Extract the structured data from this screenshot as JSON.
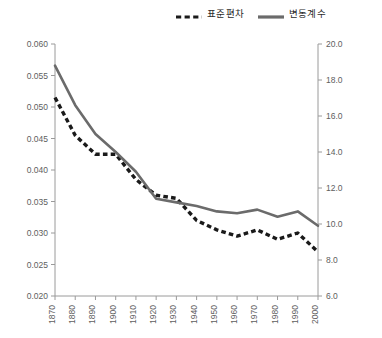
{
  "chart_data": {
    "type": "line",
    "title": "",
    "xlabel": "",
    "ylabel": "",
    "grid": false,
    "legend_position": "top-right",
    "x": [
      1870,
      1880,
      1890,
      1900,
      1910,
      1920,
      1930,
      1940,
      1950,
      1960,
      1970,
      1980,
      1990,
      2000
    ],
    "categories": [
      "1870",
      "1880",
      "1890",
      "1900",
      "1910",
      "1920",
      "1930",
      "1940",
      "1950",
      "1960",
      "1970",
      "1980",
      "1990",
      "2000"
    ],
    "axes": {
      "left": {
        "label": "",
        "ylim": [
          0.02,
          0.06
        ],
        "ticks": [
          "0.020",
          "0.025",
          "0.030",
          "0.035",
          "0.040",
          "0.045",
          "0.050",
          "0.055",
          "0.060"
        ],
        "tick_values": [
          0.02,
          0.025,
          0.03,
          0.035,
          0.04,
          0.045,
          0.05,
          0.055,
          0.06
        ]
      },
      "right": {
        "label": "",
        "ylim": [
          6.0,
          20.0
        ],
        "ticks": [
          "6.0",
          "8.0",
          "10.0",
          "12.0",
          "14.0",
          "16.0",
          "18.0",
          "20.0"
        ],
        "tick_values": [
          6.0,
          8.0,
          10.0,
          12.0,
          14.0,
          16.0,
          18.0,
          20.0
        ]
      }
    },
    "series": [
      {
        "name": "표준편차",
        "axis": "left",
        "style": "dashed",
        "color": "#1a1a1a",
        "values": [
          0.0515,
          0.0455,
          0.0425,
          0.0425,
          0.0385,
          0.036,
          0.0355,
          0.032,
          0.0305,
          0.0295,
          0.0305,
          0.029,
          0.03,
          0.027
        ]
      },
      {
        "name": "변동계수",
        "axis": "right",
        "style": "solid",
        "color": "#6b6b6b",
        "values": [
          18.8,
          16.6,
          15.0,
          14.0,
          12.9,
          11.4,
          11.2,
          11.0,
          10.7,
          10.6,
          10.8,
          10.4,
          10.7,
          9.9
        ]
      }
    ]
  },
  "legend": {
    "entries": [
      {
        "label": "표준편차",
        "swatch": "dashed-line-swatch",
        "color": "#1a1a1a"
      },
      {
        "label": "변동계수",
        "swatch": "solid-line-swatch",
        "color": "#6b6b6b"
      }
    ]
  },
  "colors": {
    "dashed_series": "#1a1a1a",
    "solid_series": "#6b6b6b",
    "axis": "#9a9a9a",
    "tick_text": "#5e5e5e",
    "background": "#ffffff"
  }
}
